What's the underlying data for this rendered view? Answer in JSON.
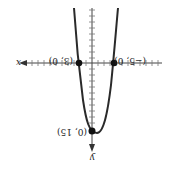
{
  "figure": {
    "orientation": "rotated 180 degrees",
    "x_axis_label": "x",
    "y_axis_label": "y",
    "points": [
      {
        "label": "(3, 0)",
        "role": "x-intercept"
      },
      {
        "label": "(−5, 0)",
        "role": "x-intercept"
      },
      {
        "label": "(0, 15)",
        "role": "y-intercept"
      }
    ],
    "curve": "parabola",
    "colors": {
      "curve": "#2a2a2a",
      "axis": "#444444",
      "point": "#111111"
    }
  }
}
